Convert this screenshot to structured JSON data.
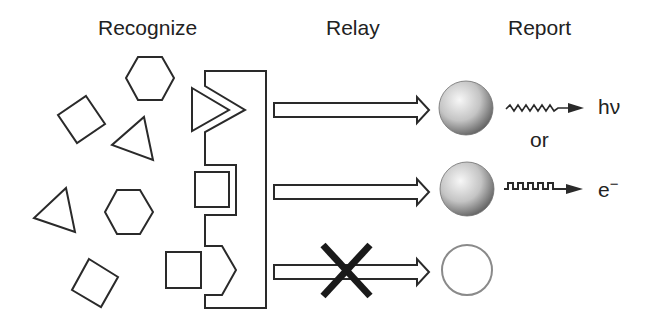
{
  "headings": {
    "recognize": "Recognize",
    "relay": "Relay",
    "report": "Report"
  },
  "outputs": {
    "photon": "hν",
    "or": "or",
    "electron": "e",
    "electron_sup": "−"
  },
  "colors": {
    "stroke": "#2a2a2a",
    "sphere_light": "#f4f4f4",
    "sphere_dark": "#6e6e6e",
    "empty_circle": "#8a8a8a",
    "cross": "#1a1a1a"
  },
  "diagram": {
    "analytes": [
      "square",
      "hexagon",
      "triangle",
      "triangle",
      "hexagon",
      "square",
      "square"
    ],
    "receptor_sites": [
      "triangle-site",
      "square-site",
      "mismatched-site"
    ],
    "channels": [
      {
        "relay": "arrow",
        "report": "filled-sphere",
        "signal": "wavy-arrow",
        "output": "hν"
      },
      {
        "relay": "arrow",
        "report": "filled-sphere",
        "signal": "square-wave-arrow",
        "output": "e−"
      },
      {
        "relay": "blocked-arrow",
        "report": "empty-circle",
        "signal": "none",
        "output": ""
      }
    ]
  }
}
